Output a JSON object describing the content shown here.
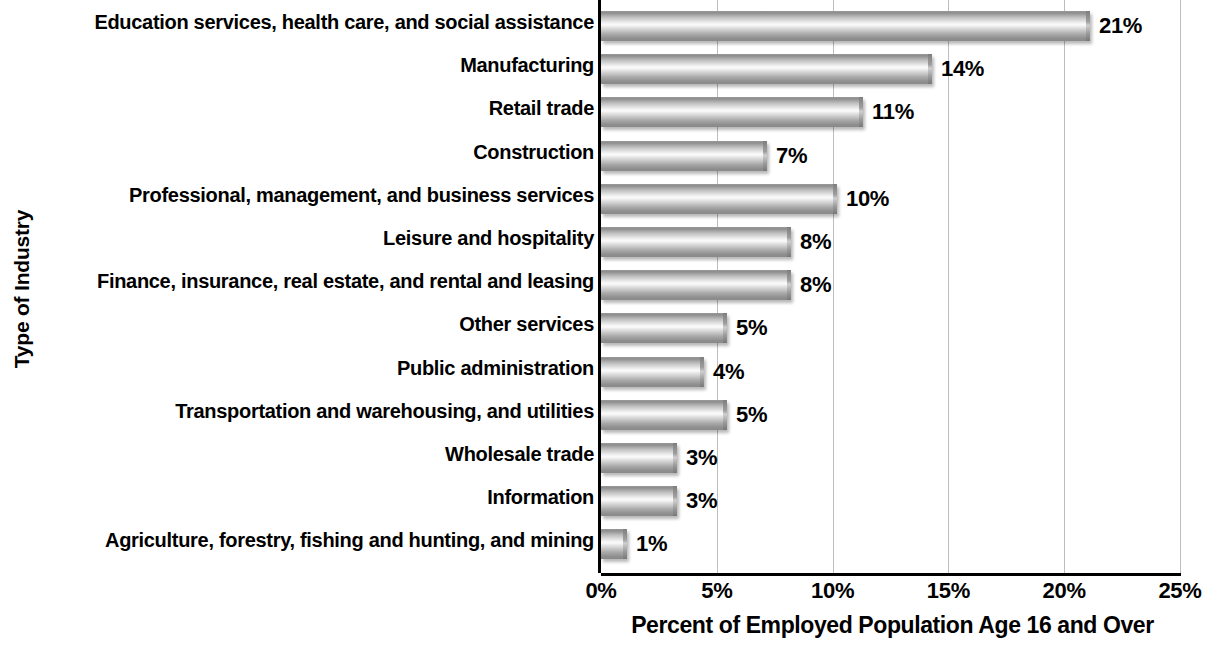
{
  "chart_data": {
    "type": "bar",
    "orientation": "horizontal",
    "title": "",
    "xlabel": "Percent of Employed Population Age 16 and Over",
    "ylabel": "Type of Industry",
    "xlim": [
      0,
      25
    ],
    "xticks": [
      0,
      5,
      10,
      15,
      20,
      25
    ],
    "xtick_labels": [
      "0%",
      "5%",
      "10%",
      "15%",
      "20%",
      "25%"
    ],
    "grid": "vertical",
    "legend": "none",
    "categories": [
      "Education services, health care, and social assistance",
      "Manufacturing",
      "Retail trade",
      "Construction",
      "Professional, management, and business services",
      "Leisure and hospitality",
      "Finance, insurance, real estate, and rental and leasing",
      "Other services",
      "Public administration",
      "Transportation and warehousing, and utilities",
      "Wholesale trade",
      "Information",
      "Agriculture, forestry, fishing and hunting, and mining"
    ],
    "values": [
      21,
      14,
      11,
      7,
      10,
      8,
      8,
      5,
      4,
      5,
      3,
      3,
      1
    ],
    "value_labels": [
      "21%",
      "14%",
      "11%",
      "7%",
      "10%",
      "8%",
      "8%",
      "5%",
      "4%",
      "5%",
      "3%",
      "3%",
      "1%"
    ],
    "bar_pixel_lengths": [
      489,
      331,
      262,
      166,
      236,
      190,
      190,
      126,
      103,
      126,
      76,
      76,
      26
    ],
    "colors": {
      "bar_light": "#fbfbfb",
      "bar_mid": "#bdbdbd",
      "bar_dark": "#8a8a8a",
      "axis": "#000000",
      "gridline": "#bdbdbd",
      "text": "#000000",
      "background": "#ffffff"
    }
  }
}
